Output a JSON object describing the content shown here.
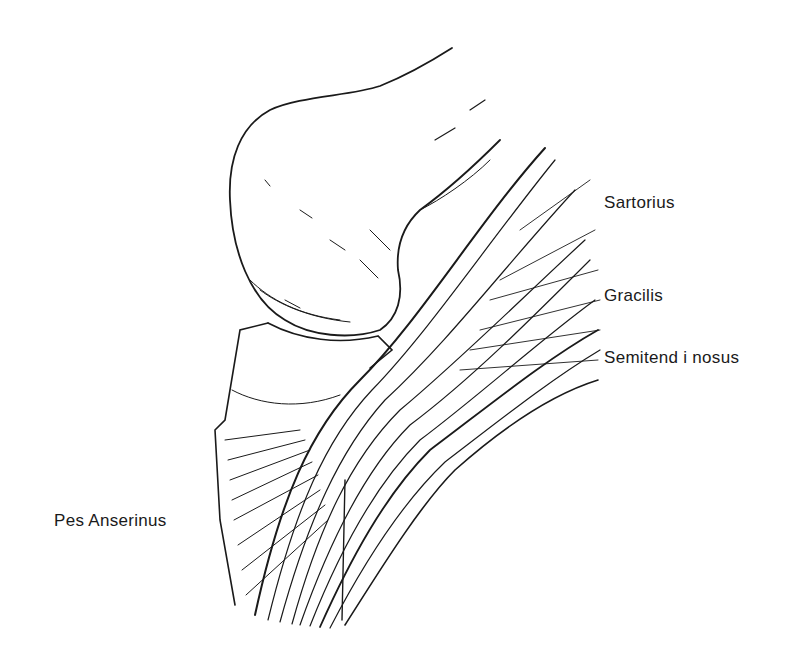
{
  "figure": {
    "labels": {
      "sartorius": "Sartorius",
      "gracilis": "Gracilis",
      "semitendinosus": "Semitend i nosus",
      "pes_anserinus": "Pes Anserinus"
    },
    "colors": {
      "ink": "#1a1a1a",
      "background": "#ffffff"
    }
  }
}
